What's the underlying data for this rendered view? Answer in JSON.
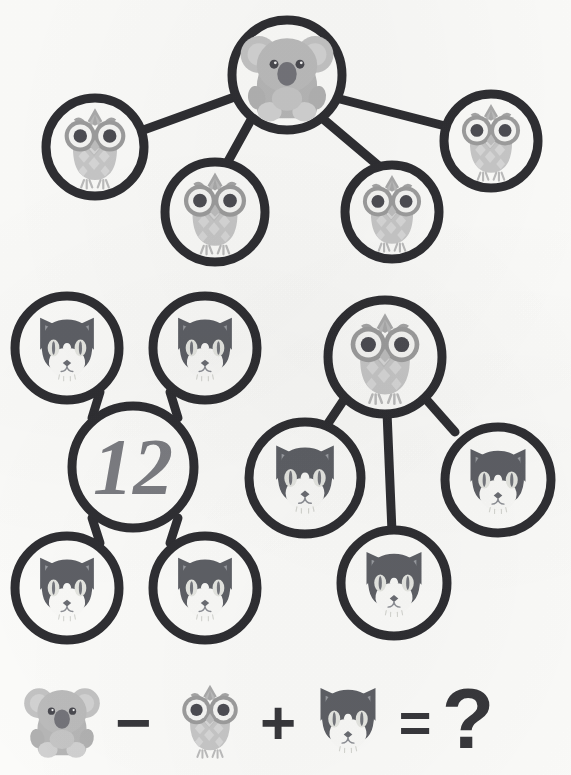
{
  "page": {
    "background_color": "#fdfdfb"
  },
  "palette": {
    "circle_stroke": "#2f2f33",
    "connector": "#2f2f33",
    "koala_body": "#b4b4b4",
    "koala_light": "#c9c9c9",
    "koala_nose": "#6e6e72",
    "koala_eye": "#44444a",
    "owl_outer": "#a3a3a3",
    "owl_mid": "#bdbdbd",
    "owl_eye": "#4a4a50",
    "owl_body": "#c2c2c2",
    "owl_body_light": "#d4d4d4",
    "cat_dark": "#5e6066",
    "cat_inner_ear": "#9a9ca1",
    "cat_white": "#fbfbf9",
    "cat_eye": "#e6e7e2",
    "cat_pupil": "#6b6d73",
    "number_color": "#7c7d82",
    "operator_color": "#38383c"
  },
  "puzzles": [
    {
      "id": "puzzle-top",
      "name": "koala-owl-cluster",
      "center": {
        "icon": "koala-icon",
        "cx": 287,
        "cy": 75,
        "r": 55
      },
      "leaves": [
        {
          "icon": "owl-icon",
          "cx": 95,
          "cy": 147,
          "r": 49,
          "name": "owl-left"
        },
        {
          "icon": "owl-icon",
          "cx": 215,
          "cy": 212,
          "r": 50,
          "name": "owl-bottom-left"
        },
        {
          "icon": "owl-icon",
          "cx": 392,
          "cy": 212,
          "r": 47,
          "name": "owl-bottom-right"
        },
        {
          "icon": "owl-icon",
          "cx": 491,
          "cy": 141,
          "r": 47,
          "name": "owl-right"
        }
      ]
    },
    {
      "id": "puzzle-middle-left",
      "name": "twelve-cat-cluster",
      "center": {
        "icon": "number-icon",
        "value": "12",
        "cx": 133,
        "cy": 467,
        "r": 61
      },
      "leaves": [
        {
          "icon": "cat-icon",
          "cx": 67,
          "cy": 348,
          "r": 52,
          "name": "cat-top-left"
        },
        {
          "icon": "cat-icon",
          "cx": 205,
          "cy": 348,
          "r": 52,
          "name": "cat-top-right"
        },
        {
          "icon": "cat-icon",
          "cx": 67,
          "cy": 588,
          "r": 52,
          "name": "cat-bottom-left"
        },
        {
          "icon": "cat-icon",
          "cx": 205,
          "cy": 588,
          "r": 52,
          "name": "cat-bottom-right"
        }
      ]
    },
    {
      "id": "puzzle-middle-right",
      "name": "owl-cat-cluster",
      "center": {
        "icon": "owl-icon",
        "cx": 385,
        "cy": 357,
        "r": 57
      },
      "leaves": [
        {
          "icon": "cat-icon",
          "cx": 305,
          "cy": 478,
          "r": 56,
          "name": "cat-left"
        },
        {
          "icon": "cat-icon",
          "cx": 498,
          "cy": 480,
          "r": 53,
          "name": "cat-right"
        },
        {
          "icon": "cat-icon",
          "cx": 394,
          "cy": 583,
          "r": 53,
          "name": "cat-bottom"
        }
      ]
    }
  ],
  "equation": {
    "name": "final-equation",
    "terms": [
      {
        "kind": "icon",
        "icon": "koala-icon",
        "name": "equation-koala",
        "cx": 62,
        "cy": 720,
        "size": 88
      },
      {
        "kind": "operator",
        "symbol": "−",
        "name": "minus-operator",
        "x": 122,
        "y": 722
      },
      {
        "kind": "icon",
        "icon": "owl-icon",
        "name": "equation-owl",
        "cx": 210,
        "cy": 720,
        "size": 84
      },
      {
        "kind": "operator",
        "symbol": "+",
        "name": "plus-operator",
        "x": 272,
        "y": 722
      },
      {
        "kind": "icon",
        "icon": "cat-icon",
        "name": "equation-cat",
        "cx": 342,
        "cy": 718,
        "size": 86
      },
      {
        "kind": "operator",
        "symbol": "=",
        "name": "equals-operator",
        "x": 400,
        "y": 722
      },
      {
        "kind": "operator",
        "symbol": "?",
        "name": "question-mark",
        "x": 448,
        "y": 718
      }
    ]
  },
  "number_values": {
    "twelve": "12"
  },
  "icon_names": [
    "koala-icon",
    "owl-icon",
    "cat-icon",
    "number-icon",
    "minus-operator",
    "plus-operator",
    "equals-operator",
    "question-mark"
  ]
}
